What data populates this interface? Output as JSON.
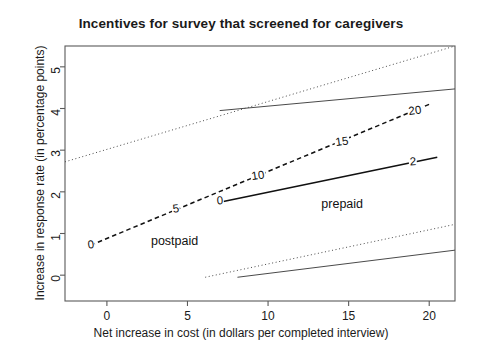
{
  "chart_data": {
    "type": "line",
    "title": "Incentives for survey that screened for caregivers",
    "xlabel": "Net increase in cost (in dollars per completed interview)",
    "ylabel": "Increase in response rate (in percentage points)",
    "xlim": [
      -2.6,
      21.6
    ],
    "ylim": [
      -0.62,
      5.5
    ],
    "xticks": [
      0,
      5,
      10,
      15,
      20
    ],
    "xticklabels": [
      "0",
      "5",
      "10",
      "15",
      "20"
    ],
    "yticks": [
      0,
      1,
      2,
      3,
      4,
      5
    ],
    "yticklabels": [
      "0",
      "1",
      "2",
      "3",
      "4",
      "5"
    ],
    "grid": false,
    "legend": "inline-annotations",
    "series": [
      {
        "name": "postpaid",
        "style": "dashed",
        "color": "#111111",
        "label_text": "postpaid",
        "label_x": 4.2,
        "label_y": 0.82,
        "x": [
          -1.0,
          20.0
        ],
        "y": [
          0.72,
          4.1
        ],
        "points": [
          {
            "label": "0",
            "x": -1.0,
            "y": 0.72
          },
          {
            "label": "5",
            "x": 4.3,
            "y": 1.58
          },
          {
            "label": "10",
            "x": 9.4,
            "y": 2.38
          },
          {
            "label": "15",
            "x": 14.6,
            "y": 3.2
          },
          {
            "label": "20",
            "x": 19.1,
            "y": 3.93
          }
        ]
      },
      {
        "name": "prepaid",
        "style": "solid",
        "color": "#111111",
        "label_text": "prepaid",
        "label_x": 14.6,
        "label_y": 1.72,
        "x": [
          7.0,
          20.5
        ],
        "y": [
          1.75,
          2.83
        ],
        "points": [
          {
            "label": "0",
            "x": 7.0,
            "y": 1.77
          },
          {
            "label": "2",
            "x": 19.0,
            "y": 2.72
          }
        ]
      }
    ],
    "confidence_bands": [
      {
        "name": "postpaid-upper-bound",
        "style": "dotted",
        "x": [
          -2.6,
          21.6
        ],
        "y": [
          2.72,
          5.5
        ]
      },
      {
        "name": "postpaid-lower-bound",
        "style": "dotted",
        "x": [
          6.1,
          21.6
        ],
        "y": [
          -0.05,
          1.22
        ]
      },
      {
        "name": "prepaid-upper-bound",
        "style": "solid",
        "x": [
          7.0,
          21.6
        ],
        "y": [
          3.95,
          4.47
        ]
      },
      {
        "name": "prepaid-lower-bound",
        "style": "solid",
        "x": [
          8.1,
          21.6
        ],
        "y": [
          -0.05,
          0.6
        ]
      }
    ]
  }
}
